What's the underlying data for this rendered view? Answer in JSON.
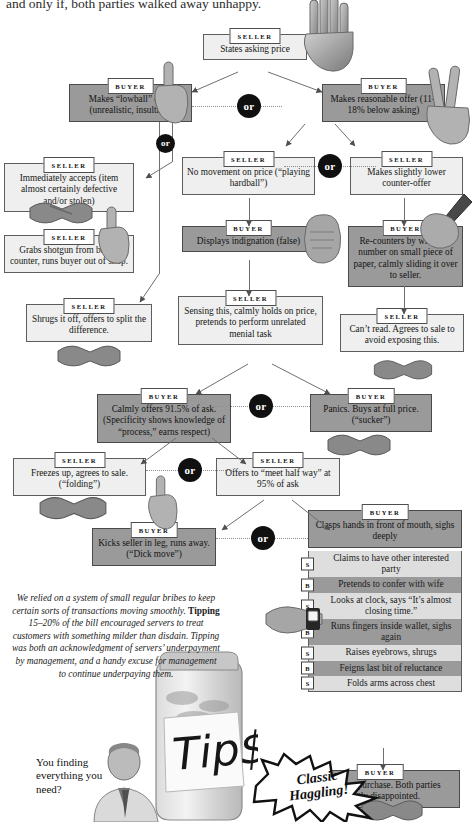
{
  "headline": "and only if, both parties walked away unhappy.",
  "labels": {
    "seller": "SELLER",
    "buyer": "BUYER",
    "or": "or",
    "s": "S",
    "b": "B"
  },
  "flow": {
    "n1": {
      "role": "SELLER",
      "text": "States asking price"
    },
    "n2": {
      "role": "BUYER",
      "text": "Makes “lowball” offer (unrealistic, insulting)"
    },
    "n3": {
      "role": "BUYER",
      "text": "Makes reasonable offer (11–18% below asking)"
    },
    "n4": {
      "role": "SELLER",
      "text": "Immediately accepts (item almost certainly defective and/or stolen)"
    },
    "n5": {
      "role": "SELLER",
      "text": "Grabs shotgun from below counter, runs buyer out of shop."
    },
    "n6": {
      "role": "SELLER",
      "text": "No movement on price (“playing hardball”)"
    },
    "n7": {
      "role": "SELLER",
      "text": "Makes slightly lower counter-offer"
    },
    "n8": {
      "role": "BUYER",
      "text": "Displays indignation (false)"
    },
    "n9": {
      "role": "BUYER",
      "text": "Re-counters by writing a number on small piece of paper, calmly sliding it over to seller."
    },
    "n10": {
      "role": "SELLER",
      "text": "Sensing this, calmly holds on price, pretends to perform unrelated menial task"
    },
    "n11": {
      "role": "SELLER",
      "text": "Can’t read. Agrees to sale to avoid exposing this."
    },
    "n12": {
      "role": "SELLER",
      "text": "Shrugs it off, offers to split the difference."
    },
    "n13": {
      "role": "BUYER",
      "text": "Calmly offers 91.5% of ask. (Specificity shows knowledge of “process,” earns respect)"
    },
    "n14": {
      "role": "BUYER",
      "text": "Panics. Buys at full price. (“sucker”)"
    },
    "n15": {
      "role": "SELLER",
      "text": "Freezes up, agrees to sale. (“folding”)"
    },
    "n16": {
      "role": "SELLER",
      "text": "Offers to “meet half way” at 95% of ask"
    },
    "n17": {
      "role": "BUYER",
      "text": "Kicks seller in leg, runs away. (“Dick move”)"
    },
    "n18": {
      "role": "BUYER",
      "text": "Clasps hands in front of mouth, sighs deeply"
    },
    "n19": {
      "role": "BUYER",
      "text": "Agrees to purchase. Both parties slightly disappointed."
    }
  },
  "sequence": [
    {
      "who": "S",
      "text": "Claims to have other interested party"
    },
    {
      "who": "B",
      "text": "Pretends to confer with wife"
    },
    {
      "who": "S",
      "text": "Looks at clock, says “It’s almost closing time.”"
    },
    {
      "who": "B",
      "text": "Runs fingers inside wallet, sighs again"
    },
    {
      "who": "S",
      "text": "Raises eyebrows, shrugs"
    },
    {
      "who": "B",
      "text": "Feigns last bit of reluctance"
    },
    {
      "who": "S",
      "text": "Folds arms across chest"
    }
  ],
  "pullquote": {
    "part1": "We relied on a system of small regular bribes to keep certain sorts of transactions moving smoothly. ",
    "bold": "Tipping",
    "part2": " 15–20% of the bill encouraged servers to treat customers with something milder than disdain. Tipping was both an acknowledgment of servers’ underpayment by management, and a handy excuse for management to continue underpaying them."
  },
  "speech": "You finding everything you need?",
  "starburst": {
    "line1": "Classic",
    "line2": "Haggling!"
  },
  "tipjar": {
    "sign": "Tip$"
  },
  "colors": {
    "seller_fill": "#eeefee",
    "buyer_fill": "#9a9a9a",
    "seq_s_fill": "#dedede",
    "seq_b_fill": "#9a9a9a",
    "or_badge": "#101010",
    "border": "#5d5d5d",
    "page": "#ffffff"
  }
}
